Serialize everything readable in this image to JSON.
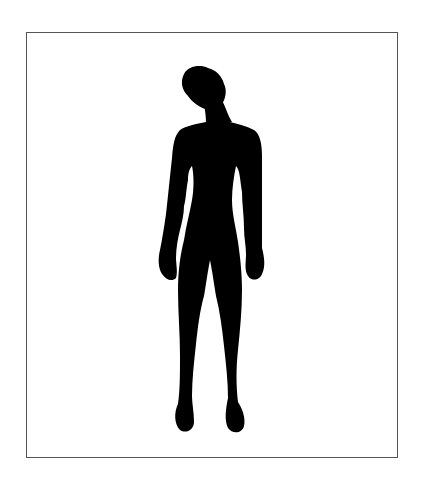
{
  "image": {
    "subject": "silhouette of a standing person with head tilted to the right",
    "frame_color": "#555555",
    "background_color": "#ffffff",
    "silhouette_color": "#000000"
  }
}
